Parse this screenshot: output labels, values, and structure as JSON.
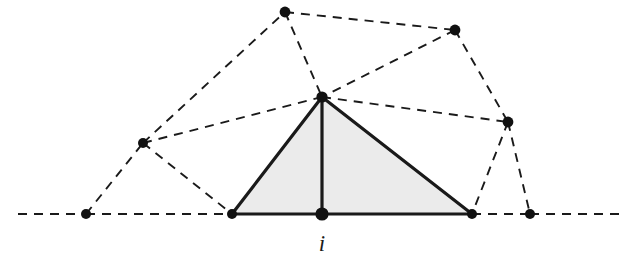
{
  "figure": {
    "type": "mesh-diagram",
    "title": "",
    "canvas": {
      "width": 643,
      "height": 275
    },
    "colors": {
      "stroke": "#1a1a1a",
      "fill": "#ebebeb",
      "vertex": "#111111",
      "background": "#ffffff"
    },
    "stroke_widths": {
      "solid": 3.2,
      "dashed": 1.9
    },
    "dash_pattern": "9 7"
  },
  "labels": [
    {
      "id": "label-i",
      "text": "i",
      "x": 322,
      "y": 232
    }
  ],
  "vertices": [
    {
      "id": "v-far-left-base",
      "name": "far-left-baseline-node",
      "x": 86,
      "y": 214,
      "r": 5.0
    },
    {
      "id": "v-left-mid",
      "name": "left-middle-node",
      "x": 143,
      "y": 143,
      "r": 5.0
    },
    {
      "id": "v-top-left",
      "name": "top-left-node",
      "x": 285,
      "y": 12,
      "r": 5.4
    },
    {
      "id": "v-top-right",
      "name": "top-right-node",
      "x": 455,
      "y": 30,
      "r": 5.4
    },
    {
      "id": "v-apex",
      "name": "apex-node",
      "x": 322,
      "y": 97,
      "r": 5.6
    },
    {
      "id": "v-right-mid",
      "name": "right-middle-node",
      "x": 508,
      "y": 122,
      "r": 5.4
    },
    {
      "id": "v-left-base",
      "name": "left-base-node",
      "x": 232,
      "y": 214,
      "r": 5.0
    },
    {
      "id": "v-center-i",
      "name": "center-node-i",
      "x": 322,
      "y": 214,
      "r": 6.6
    },
    {
      "id": "v-right-base",
      "name": "right-base-node",
      "x": 472,
      "y": 214,
      "r": 5.0
    },
    {
      "id": "v-far-right-base",
      "name": "far-right-baseline-node",
      "x": 530,
      "y": 214,
      "r": 5.0
    }
  ],
  "dashed_edges": [
    {
      "id": "e-d-01",
      "name": "baseline-left-extension",
      "x1": 18,
      "y1": 214,
      "x2": 86,
      "y2": 214
    },
    {
      "id": "e-d-02",
      "name": "baseline-far-left-to-left-base",
      "x1": 86,
      "y1": 214,
      "x2": 232,
      "y2": 214
    },
    {
      "id": "e-d-03",
      "name": "baseline-right-base-to-far-right",
      "x1": 472,
      "y1": 214,
      "x2": 530,
      "y2": 214
    },
    {
      "id": "e-d-04",
      "name": "baseline-right-extension",
      "x1": 530,
      "y1": 214,
      "x2": 625,
      "y2": 214
    },
    {
      "id": "e-d-05",
      "name": "far-left-base-to-left-mid",
      "x1": 86,
      "y1": 214,
      "x2": 143,
      "y2": 143
    },
    {
      "id": "e-d-06",
      "name": "left-mid-to-left-base",
      "x1": 143,
      "y1": 143,
      "x2": 232,
      "y2": 214
    },
    {
      "id": "e-d-07",
      "name": "left-mid-to-top-left",
      "x1": 143,
      "y1": 143,
      "x2": 285,
      "y2": 12
    },
    {
      "id": "e-d-08",
      "name": "left-mid-to-apex",
      "x1": 143,
      "y1": 143,
      "x2": 322,
      "y2": 97
    },
    {
      "id": "e-d-09",
      "name": "top-left-to-apex",
      "x1": 285,
      "y1": 12,
      "x2": 322,
      "y2": 97
    },
    {
      "id": "e-d-10",
      "name": "top-left-to-top-right",
      "x1": 285,
      "y1": 12,
      "x2": 455,
      "y2": 30
    },
    {
      "id": "e-d-11",
      "name": "top-right-to-apex",
      "x1": 455,
      "y1": 30,
      "x2": 322,
      "y2": 97
    },
    {
      "id": "e-d-12",
      "name": "top-right-to-right-mid",
      "x1": 455,
      "y1": 30,
      "x2": 508,
      "y2": 122
    },
    {
      "id": "e-d-13",
      "name": "apex-to-right-mid",
      "x1": 322,
      "y1": 97,
      "x2": 508,
      "y2": 122
    },
    {
      "id": "e-d-14",
      "name": "right-mid-to-right-base",
      "x1": 508,
      "y1": 122,
      "x2": 472,
      "y2": 214
    },
    {
      "id": "e-d-15",
      "name": "right-mid-to-far-right-base",
      "x1": 508,
      "y1": 122,
      "x2": 530,
      "y2": 214
    }
  ],
  "shaded_region": {
    "id": "shaded-triangle-fan",
    "name": "shaded-support-triangle",
    "points": "232,214 322,97 472,214",
    "fill": "#ebebeb"
  },
  "solid_edges": [
    {
      "id": "e-s-1",
      "name": "solid-edge-left-base-to-apex",
      "x1": 232,
      "y1": 214,
      "x2": 322,
      "y2": 97
    },
    {
      "id": "e-s-2",
      "name": "solid-edge-apex-to-right-base",
      "x1": 322,
      "y1": 97,
      "x2": 472,
      "y2": 214
    },
    {
      "id": "e-s-3",
      "name": "solid-edge-left-base-to-center",
      "x1": 232,
      "y1": 214,
      "x2": 322,
      "y2": 214
    },
    {
      "id": "e-s-4",
      "name": "solid-edge-center-to-right-base",
      "x1": 322,
      "y1": 214,
      "x2": 472,
      "y2": 214
    },
    {
      "id": "e-s-5",
      "name": "solid-edge-apex-to-center",
      "x1": 322,
      "y1": 97,
      "x2": 322,
      "y2": 214
    }
  ]
}
